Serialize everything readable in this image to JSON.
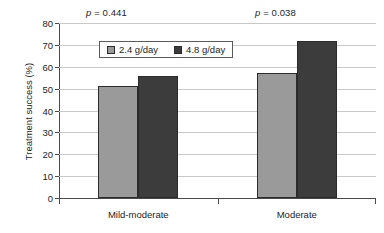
{
  "chart_data": {
    "type": "bar",
    "title": "",
    "xlabel": "",
    "ylabel": "Treatment success (%)",
    "ylim": [
      0,
      80
    ],
    "ytick_step": 10,
    "yticks": [
      "80",
      "70",
      "60",
      "50",
      "40",
      "30",
      "20",
      "10",
      "0"
    ],
    "grid": true,
    "legend_position": "inside-top-left",
    "categories": [
      "Mild-moderate",
      "Moderate"
    ],
    "series": [
      {
        "name": "2.4 g/day",
        "values": [
          51,
          57
        ],
        "color": "#9a9a9a"
      },
      {
        "name": "4.8 g/day",
        "values": [
          56,
          72
        ],
        "color": "#3c3c3c"
      }
    ],
    "annotations": [
      {
        "name": "p-value-mild-moderate",
        "symbol": "p",
        "text": " = 0.441",
        "full": "p = 0.441"
      },
      {
        "name": "p-value-moderate",
        "symbol": "p",
        "text": " = 0.038",
        "full": "p = 0.038"
      }
    ]
  },
  "axis_colors": {
    "gridline": "#c9c9c9",
    "axis": "#4a4a4a",
    "bar_outline": "#2b2b2b"
  }
}
